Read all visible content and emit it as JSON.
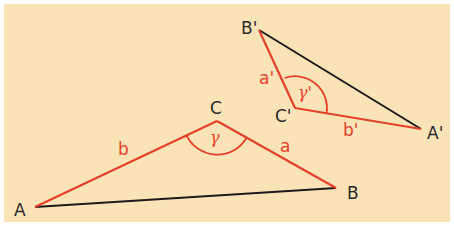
{
  "colors": {
    "background": "#fbe3b8",
    "red": "#e5412a",
    "black": "#1a1a1a",
    "label_dark": "#2a2a2a"
  },
  "triangle1": {
    "vertices": {
      "A": "A",
      "B": "B",
      "C": "C"
    },
    "sides": {
      "a": "a",
      "b": "b"
    },
    "angle": "γ"
  },
  "triangle2": {
    "vertices": {
      "A": "A'",
      "B": "B'",
      "C": "C'"
    },
    "sides": {
      "a": "a'",
      "b": "b'"
    },
    "angle": "γ'"
  }
}
